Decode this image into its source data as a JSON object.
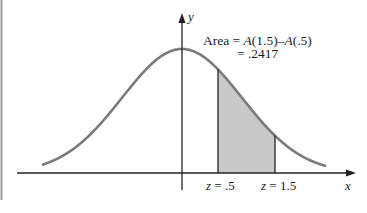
{
  "figure": {
    "axes": {
      "x_label": "x",
      "y_label": "y"
    },
    "annotation": {
      "line1_prefix": "Area = ",
      "line1_expr_a": "A",
      "line1_expr_a_arg": "(1.5)",
      "line1_minus": "–",
      "line1_expr_b": "A",
      "line1_expr_b_arg": "(.5)",
      "line2": "= .2417"
    },
    "markers": [
      {
        "label_var": "z",
        "label_eq": " = .5",
        "z": 0.5
      },
      {
        "label_var": "z",
        "label_eq": " = 1.5",
        "z": 1.5
      }
    ],
    "shaded_area_value": ".2417",
    "colors": {
      "curve": "#7a7a7a",
      "shade": "#c9c9c9",
      "axis": "#222222",
      "frame_left": "#9a9a9a"
    }
  },
  "chart_data": {
    "type": "area",
    "title": "",
    "xlabel": "x",
    "ylabel": "y",
    "curve": "standard normal density",
    "shaded_interval": [
      0.5,
      1.5
    ],
    "shaded_area": 0.2417,
    "annotation": "Area = A(1.5) − A(.5) = .2417",
    "tick_labels": [
      "z = .5",
      "z = 1.5"
    ]
  }
}
